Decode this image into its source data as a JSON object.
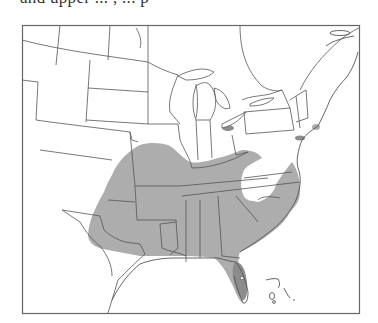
{
  "page": {
    "caption_fragment": "and upper ... , ... p",
    "caption_note": "Text line cut off at top edge; only descenders visible"
  },
  "map": {
    "type": "range-map",
    "region": "Eastern and Central United States",
    "range_color": "#a9a9a9",
    "range_dark_color": "#8c8c8c",
    "border_color": "#555555",
    "frame": {
      "x": 22,
      "y": 25,
      "width": 337,
      "height": 288
    },
    "range_description": "Shaded distribution across the southeastern US from eastern Texas/Oklahoma north to Missouri/southern Illinois and Indiana, east through Tennessee, the Gulf states, Georgia, the Carolinas and Virginia coastal plain, south through Florida; Appalachian highlands unshaded; small isolated patches near Lake Erie, Long Island/Connecticut coast and Cape Cod.",
    "labels": []
  }
}
